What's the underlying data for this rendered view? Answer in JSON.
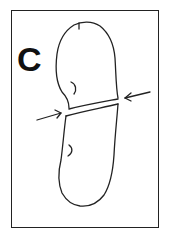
{
  "figure": {
    "panel_label": "C",
    "colors": {
      "line": "#222222",
      "background": "#ffffff"
    },
    "arrows": [
      {
        "side": "left",
        "direction": "pointing-right"
      },
      {
        "side": "right",
        "direction": "pointing-left"
      }
    ]
  }
}
